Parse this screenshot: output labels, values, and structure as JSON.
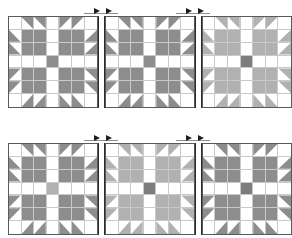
{
  "diagram": {
    "colors": {
      "background": "#ffffff",
      "fabric_light": "#ffffff",
      "fabric_medium": "#b1b1b1",
      "fabric_dark": "#8d8d8d",
      "fabric_darker": "#7d7d7d",
      "grid_line": "#c9c9c9",
      "block_outline": "#5a5a5a",
      "seam_line": "#2b2b2b",
      "arrow": "#1d1d1d"
    },
    "geometry": {
      "block_size": 92,
      "grid_divisions": 7,
      "row1_top": 16,
      "row2_top": 143,
      "row_left": 8,
      "join_width": 7
    },
    "rows": [
      {
        "name": "row-1",
        "blocks": [
          {
            "name": "block-r1-c1",
            "paw": "#8d8d8d",
            "center": "#8d8d8d"
          },
          {
            "name": "block-r1-c2",
            "paw": "#8d8d8d",
            "center": "#8d8d8d"
          },
          {
            "name": "block-r1-c3",
            "paw": "#b1b1b1",
            "center": "#7d7d7d"
          }
        ],
        "seam_markers": [
          {
            "name": "seam-marker-r1-1",
            "left": 84,
            "width": 34,
            "direction": "right"
          },
          {
            "name": "seam-marker-r1-2",
            "left": 176,
            "width": 34,
            "direction": "right"
          }
        ]
      },
      {
        "name": "row-2",
        "blocks": [
          {
            "name": "block-r2-c1",
            "paw": "#8d8d8d",
            "center": "#b1b1b1"
          },
          {
            "name": "block-r2-c2",
            "paw": "#b1b1b1",
            "center": "#7d7d7d"
          },
          {
            "name": "block-r2-c3",
            "paw": "#8d8d8d",
            "center": "#7d7d7d"
          }
        ],
        "seam_markers": [
          {
            "name": "seam-marker-r2-1",
            "left": 84,
            "width": 34,
            "direction": "right"
          },
          {
            "name": "seam-marker-r2-2",
            "left": 176,
            "width": 34,
            "direction": "right"
          }
        ]
      }
    ]
  }
}
